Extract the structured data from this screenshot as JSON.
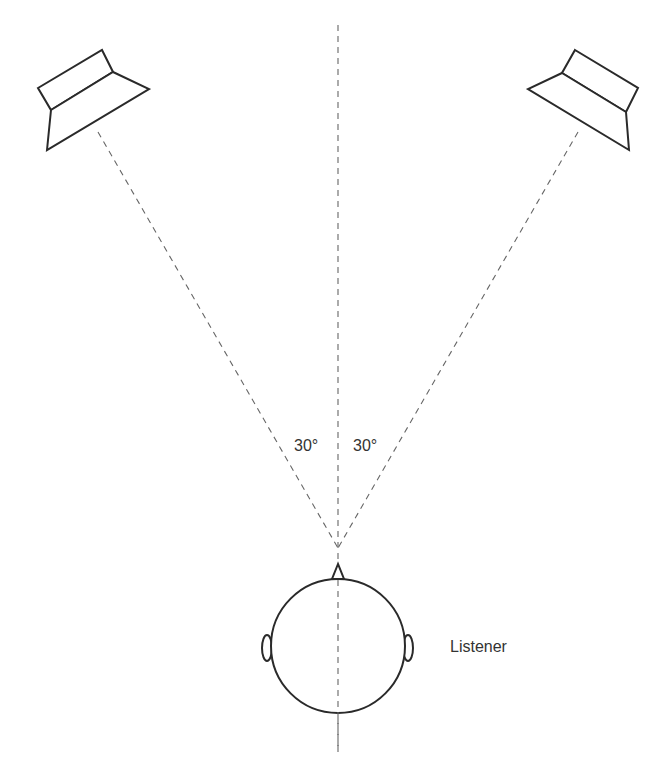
{
  "diagram": {
    "type": "stereo-listening-setup",
    "colors": {
      "stroke": "#2a2a2a",
      "dashed": "#666666",
      "text": "#333333",
      "background": "#ffffff"
    },
    "labels": {
      "left_angle": "30°",
      "right_angle": "30°",
      "listener": "Listener"
    },
    "elements": [
      {
        "id": "left-speaker",
        "kind": "loudspeaker"
      },
      {
        "id": "right-speaker",
        "kind": "loudspeaker"
      },
      {
        "id": "center-axis",
        "kind": "dashed-line"
      },
      {
        "id": "left-sightline",
        "kind": "dashed-line"
      },
      {
        "id": "right-sightline",
        "kind": "dashed-line"
      },
      {
        "id": "listener-head",
        "kind": "head-top-view"
      }
    ],
    "angle_between_speakers_deg": 60
  }
}
